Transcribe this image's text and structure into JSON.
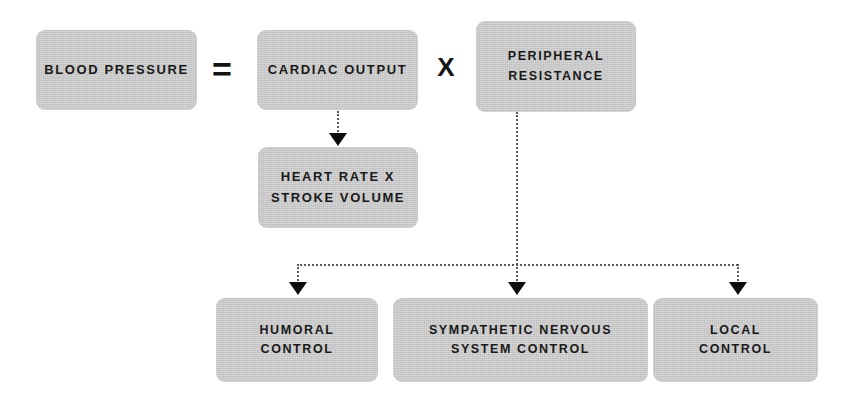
{
  "diagram": {
    "accent_box_color": "#c5c5c5",
    "text_color": "#191919",
    "connector_color": "#5a5a5a",
    "nodes": {
      "blood_pressure": {
        "label": "BLOOD PRESSURE"
      },
      "cardiac_output": {
        "label": "CARDIAC OUTPUT"
      },
      "peripheral_resistance": {
        "line1": "PERIPHERAL",
        "line2": "RESISTANCE"
      },
      "heart_rate": {
        "line1": "HEART RATE X",
        "line2": "STROKE VOLUME"
      },
      "humoral_control": {
        "line1": "HUMORAL",
        "line2": "CONTROL"
      },
      "sympathetic_control": {
        "line1": "SYMPATHETIC NERVOUS",
        "line2": "SYSTEM CONTROL"
      },
      "local_control": {
        "line1": "LOCAL",
        "line2": "CONTROL"
      }
    },
    "operators": {
      "equals": "=",
      "times": "X"
    }
  }
}
